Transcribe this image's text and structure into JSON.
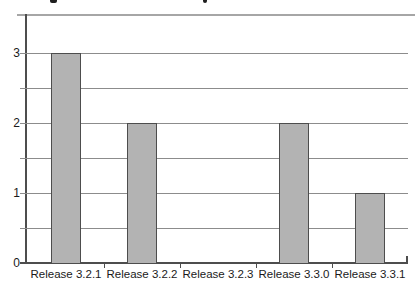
{
  "chart_data": {
    "type": "bar",
    "title": "",
    "xlabel": "",
    "ylabel": "",
    "categories": [
      "Release 3.2.1",
      "Release 3.2.2",
      "Release 3.2.3",
      "Release 3.3.0",
      "Release 3.3.1"
    ],
    "values": [
      3,
      2,
      0,
      2,
      1
    ],
    "ylim": [
      0,
      3.5
    ],
    "yticks": [
      0,
      1,
      2,
      3
    ],
    "grid": true,
    "gridline_interval": 0.5,
    "legend_position": "none",
    "bar_color": "#b3b3b3",
    "bar_border_color": "#4d4d4d",
    "gridline_color": "#8c8c8c",
    "axis_color": "#4d4d4d",
    "top_rule_color": "#a6a6a6",
    "label_color": "#1a1a1a"
  }
}
